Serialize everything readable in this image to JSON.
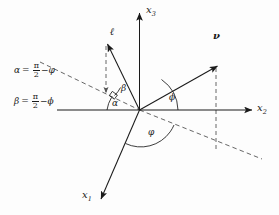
{
  "figure": {
    "background_color": "#fdfdfd",
    "line_color": "#1a1a1a",
    "dash_color": "#555555"
  },
  "axes": [
    {
      "id": "x3",
      "name": "x3-axis",
      "label": "x",
      "subscript": "3",
      "direction": "up"
    },
    {
      "id": "x2",
      "name": "x2-axis",
      "label": "x",
      "subscript": "2",
      "direction": "right"
    },
    {
      "id": "x1",
      "name": "x1-axis",
      "label": "x",
      "subscript": "1",
      "direction": "down-left"
    }
  ],
  "vectors": [
    {
      "id": "l",
      "name": "vector-l",
      "label": "ℓ"
    },
    {
      "id": "nu",
      "name": "vector-nu",
      "label": "ν"
    }
  ],
  "angles": [
    {
      "id": "alpha",
      "label": "α"
    },
    {
      "id": "beta",
      "label": "β"
    },
    {
      "id": "phi",
      "label": "ϕ"
    },
    {
      "id": "varphi",
      "label": "φ"
    }
  ],
  "equations": [
    {
      "id": "eq-alpha",
      "lhs": "α",
      "eq": "=",
      "numerator": "π",
      "denominator": "2",
      "minus": "−",
      "rhs": "φ"
    },
    {
      "id": "eq-beta",
      "lhs": "β",
      "eq": "=",
      "numerator": "π",
      "denominator": "2",
      "minus": "−",
      "rhs": "ϕ"
    }
  ]
}
